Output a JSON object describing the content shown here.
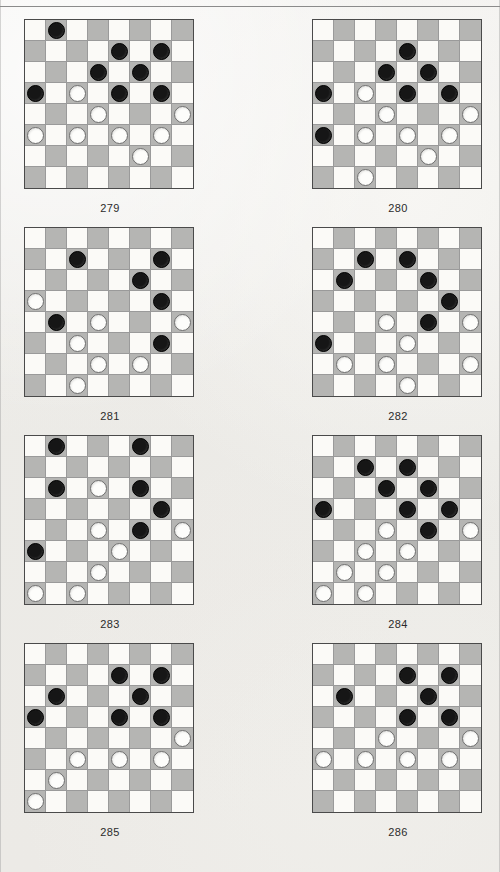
{
  "page": {
    "background_color": "#efeeec",
    "rule_color": "#8b8b8b",
    "light_square_color": "#fbfaf7",
    "dark_square_color": "#b5b5b3",
    "black_piece_color": "#161616",
    "white_piece_color": "#fdfdfb",
    "board_size": 8
  },
  "diagrams": [
    {
      "caption": "279",
      "black": [
        [
          0,
          1
        ],
        [
          1,
          4
        ],
        [
          1,
          6
        ],
        [
          2,
          3
        ],
        [
          2,
          5
        ],
        [
          3,
          0
        ],
        [
          3,
          4
        ],
        [
          3,
          6
        ]
      ],
      "white": [
        [
          3,
          2
        ],
        [
          4,
          3
        ],
        [
          4,
          7
        ],
        [
          5,
          0
        ],
        [
          5,
          2
        ],
        [
          5,
          4
        ],
        [
          5,
          6
        ],
        [
          6,
          5
        ]
      ]
    },
    {
      "caption": "280",
      "black": [
        [
          1,
          4
        ],
        [
          2,
          3
        ],
        [
          2,
          5
        ],
        [
          3,
          0
        ],
        [
          3,
          4
        ],
        [
          3,
          6
        ],
        [
          5,
          0
        ]
      ],
      "white": [
        [
          3,
          2
        ],
        [
          4,
          3
        ],
        [
          4,
          7
        ],
        [
          5,
          2
        ],
        [
          5,
          4
        ],
        [
          5,
          6
        ],
        [
          6,
          5
        ],
        [
          7,
          2
        ]
      ]
    },
    {
      "caption": "281",
      "black": [
        [
          1,
          2
        ],
        [
          1,
          6
        ],
        [
          2,
          5
        ],
        [
          3,
          6
        ],
        [
          4,
          1
        ],
        [
          5,
          6
        ]
      ],
      "white": [
        [
          3,
          0
        ],
        [
          4,
          3
        ],
        [
          4,
          7
        ],
        [
          5,
          2
        ],
        [
          6,
          3
        ],
        [
          6,
          5
        ],
        [
          7,
          2
        ]
      ]
    },
    {
      "caption": "282",
      "black": [
        [
          1,
          2
        ],
        [
          1,
          4
        ],
        [
          2,
          1
        ],
        [
          2,
          5
        ],
        [
          3,
          6
        ],
        [
          4,
          5
        ],
        [
          5,
          0
        ]
      ],
      "white": [
        [
          4,
          3
        ],
        [
          4,
          7
        ],
        [
          5,
          4
        ],
        [
          6,
          1
        ],
        [
          6,
          3
        ],
        [
          6,
          7
        ],
        [
          7,
          4
        ]
      ]
    },
    {
      "caption": "283",
      "black": [
        [
          0,
          1
        ],
        [
          0,
          5
        ],
        [
          2,
          1
        ],
        [
          2,
          5
        ],
        [
          3,
          6
        ],
        [
          4,
          5
        ],
        [
          5,
          0
        ]
      ],
      "white": [
        [
          2,
          3
        ],
        [
          4,
          3
        ],
        [
          4,
          7
        ],
        [
          5,
          4
        ],
        [
          6,
          3
        ],
        [
          7,
          0
        ],
        [
          7,
          2
        ]
      ]
    },
    {
      "caption": "284",
      "black": [
        [
          1,
          2
        ],
        [
          1,
          4
        ],
        [
          2,
          3
        ],
        [
          2,
          5
        ],
        [
          3,
          0
        ],
        [
          3,
          4
        ],
        [
          3,
          6
        ],
        [
          4,
          5
        ]
      ],
      "white": [
        [
          4,
          3
        ],
        [
          4,
          7
        ],
        [
          5,
          2
        ],
        [
          5,
          4
        ],
        [
          6,
          1
        ],
        [
          6,
          3
        ],
        [
          7,
          0
        ],
        [
          7,
          2
        ]
      ]
    },
    {
      "caption": "285",
      "black": [
        [
          1,
          4
        ],
        [
          1,
          6
        ],
        [
          2,
          1
        ],
        [
          2,
          5
        ],
        [
          3,
          0
        ],
        [
          3,
          4
        ],
        [
          3,
          6
        ]
      ],
      "white": [
        [
          4,
          7
        ],
        [
          5,
          2
        ],
        [
          5,
          4
        ],
        [
          5,
          6
        ],
        [
          6,
          1
        ],
        [
          7,
          0
        ]
      ]
    },
    {
      "caption": "286",
      "black": [
        [
          1,
          4
        ],
        [
          1,
          6
        ],
        [
          2,
          1
        ],
        [
          2,
          5
        ],
        [
          3,
          4
        ],
        [
          3,
          6
        ]
      ],
      "white": [
        [
          4,
          3
        ],
        [
          4,
          7
        ],
        [
          5,
          0
        ],
        [
          5,
          2
        ],
        [
          5,
          4
        ],
        [
          5,
          6
        ]
      ]
    }
  ]
}
